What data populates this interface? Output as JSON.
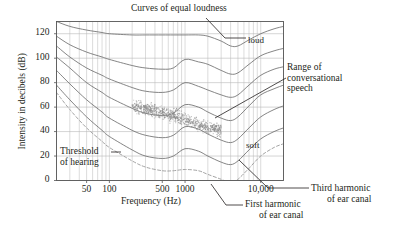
{
  "figure": {
    "title": "Curves of equal loudness",
    "x_axis_title": "Frequency (Hz)",
    "y_axis_title": "Intensity in decibels (dB)"
  },
  "annotations": {
    "loud": "loud",
    "soft": "soft",
    "threshold": [
      "Threshold",
      "of hearing"
    ],
    "range_speech": [
      "Range of",
      "conversational",
      "speech"
    ],
    "third_harmonic": [
      "Third harmonic",
      "of ear canal"
    ],
    "first_harmonic": [
      "First harmonic",
      "of ear canal"
    ]
  },
  "colors": {
    "ink": "#231f20",
    "grid": "#b8b8b8",
    "curve": "#6f6f6f",
    "dashed": "#9a9a9a",
    "scatter": "#8a8a8a",
    "frame": "#555555",
    "background": "#ffffff"
  },
  "chart_data": {
    "type": "line",
    "title": "Curves of equal loudness",
    "xlabel": "Frequency (Hz)",
    "ylabel": "Intensity in decibels (dB)",
    "x_scale": "log",
    "xlim": [
      20,
      20000
    ],
    "ylim": [
      0,
      130
    ],
    "yticks": [
      0,
      20,
      40,
      60,
      80,
      100,
      120
    ],
    "xticks": [
      50,
      100,
      500,
      1000,
      10000
    ],
    "xtick_labels": [
      "50",
      "100",
      "500",
      "1000",
      "10,000"
    ],
    "grid": true,
    "legend": "none",
    "series": [
      {
        "name": "110 phon (loud)",
        "style": "solid",
        "x": [
          20,
          30,
          50,
          80,
          100,
          200,
          300,
          500,
          700,
          1000,
          1500,
          2000,
          3000,
          4000,
          5000,
          7000,
          10000,
          15000,
          20000
        ],
        "values": [
          130,
          126,
          123,
          121,
          120,
          119,
          119,
          119,
          119,
          119,
          119,
          118,
          114,
          110,
          110,
          115,
          120,
          124,
          126
        ]
      },
      {
        "name": "90 phon",
        "style": "solid",
        "x": [
          20,
          30,
          50,
          80,
          100,
          200,
          300,
          500,
          700,
          1000,
          1500,
          2000,
          3000,
          4000,
          5000,
          7000,
          10000,
          15000,
          20000
        ],
        "values": [
          118,
          111,
          105,
          101,
          99,
          94,
          92,
          91,
          92,
          99,
          97,
          95,
          90,
          87,
          88,
          95,
          102,
          106,
          108
        ]
      },
      {
        "name": "70 phon",
        "style": "solid",
        "x": [
          20,
          30,
          50,
          80,
          100,
          200,
          300,
          500,
          700,
          1000,
          1500,
          2000,
          3000,
          4000,
          5000,
          7000,
          10000,
          15000,
          20000
        ],
        "values": [
          110,
          101,
          92,
          86,
          83,
          76,
          73,
          72,
          74,
          80,
          77,
          74,
          70,
          68,
          70,
          78,
          86,
          91,
          93
        ]
      },
      {
        "name": "50 phon",
        "style": "solid",
        "x": [
          20,
          30,
          50,
          80,
          100,
          200,
          300,
          500,
          700,
          1000,
          1500,
          2000,
          3000,
          4000,
          5000,
          7000,
          10000,
          15000,
          20000
        ],
        "values": [
          101,
          92,
          80,
          72,
          68,
          59,
          55,
          53,
          55,
          62,
          60,
          56,
          51,
          49,
          52,
          61,
          70,
          75,
          78
        ]
      },
      {
        "name": "30 phon",
        "style": "solid",
        "x": [
          20,
          30,
          50,
          80,
          100,
          200,
          300,
          500,
          700,
          1000,
          1500,
          2000,
          3000,
          4000,
          5000,
          7000,
          10000,
          15000,
          20000
        ],
        "values": [
          90,
          79,
          66,
          56,
          51,
          41,
          37,
          35,
          37,
          44,
          42,
          38,
          33,
          31,
          34,
          43,
          52,
          58,
          61
        ]
      },
      {
        "name": "10 phon (soft)",
        "style": "solid",
        "x": [
          20,
          30,
          50,
          80,
          100,
          200,
          300,
          500,
          700,
          1000,
          1500,
          2000,
          3000,
          4000,
          5000,
          7000,
          10000,
          15000,
          20000
        ],
        "values": [
          78,
          66,
          52,
          41,
          36,
          25,
          20,
          18,
          20,
          26,
          24,
          20,
          15,
          13,
          16,
          25,
          34,
          40,
          43
        ]
      },
      {
        "name": "Threshold of hearing",
        "style": "dashed",
        "x": [
          20,
          30,
          50,
          80,
          100,
          200,
          300,
          500,
          700,
          1000,
          1500,
          2000,
          3000,
          4000,
          5000,
          7000,
          10000,
          15000,
          20000
        ],
        "values": [
          72,
          58,
          43,
          32,
          27,
          16,
          11,
          8,
          8,
          9,
          8,
          5,
          1,
          -2,
          1,
          10,
          20,
          27,
          30
        ]
      }
    ],
    "scatter": {
      "name": "Range of conversational speech",
      "x": [
        200,
        250,
        300,
        350,
        400,
        500,
        600,
        700,
        800,
        1000,
        1200,
        1500,
        1800,
        2200,
        2600,
        3000
      ],
      "values": [
        60,
        60,
        59,
        58,
        57,
        56,
        54,
        53,
        52,
        50,
        48,
        46,
        44,
        43,
        42,
        41
      ],
      "spread_db": 4
    },
    "markers": [
      {
        "name": "First harmonic of ear canal",
        "x": 3500,
        "y": 0
      },
      {
        "name": "Third harmonic of ear canal",
        "x": 10500,
        "y": 8
      }
    ]
  }
}
